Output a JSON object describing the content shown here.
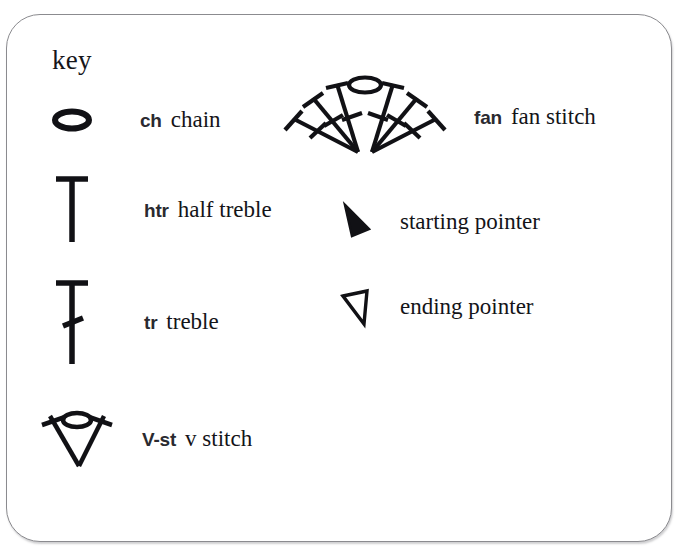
{
  "heading": "key",
  "stitches": [
    {
      "id": "ch",
      "symbol_name": "chain-symbol",
      "abbr": "ch",
      "description": "chain"
    },
    {
      "id": "htr",
      "symbol_name": "half-treble-symbol",
      "abbr": "htr",
      "description": "half treble"
    },
    {
      "id": "tr",
      "symbol_name": "treble-symbol",
      "abbr": "tr",
      "description": "treble"
    },
    {
      "id": "vst",
      "symbol_name": "v-stitch-symbol",
      "abbr": "V-st",
      "description": "v stitch"
    },
    {
      "id": "fan",
      "symbol_name": "fan-stitch-symbol",
      "abbr": "fan",
      "description": "fan stitch"
    }
  ],
  "pointers": [
    {
      "id": "start",
      "symbol_name": "starting-pointer-symbol",
      "label": "starting pointer",
      "fill": "#111115"
    },
    {
      "id": "end",
      "symbol_name": "ending-pointer-symbol",
      "label": "ending pointer",
      "fill": "none"
    }
  ],
  "colors": {
    "ink": "#111115",
    "border": "#8b8b8f",
    "background": "#ffffff"
  }
}
